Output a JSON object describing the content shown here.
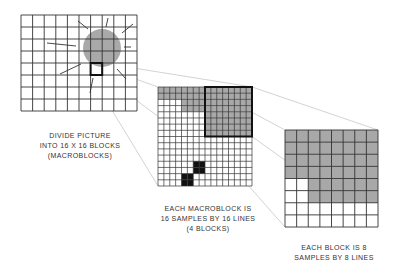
{
  "colors": {
    "grid_line": "#333333",
    "gray_fill": "#a8a8a8",
    "circle_fill": "#a9a9a9",
    "black_fill": "#111111",
    "projection_line": "#c8c8c8",
    "ray_line": "#333333"
  },
  "picture": {
    "caption": [
      "DIVIDE PICTURE",
      "INTO 16 X 16 BLOCKS",
      "(MACROBLOCKS)"
    ],
    "cols": 10,
    "rows": 8,
    "x": 21,
    "y": 15,
    "w": 116,
    "h": 96,
    "circle": {
      "cx": 102,
      "cy": 48,
      "r": 19
    },
    "highlight": {
      "col": 6,
      "row": 4
    },
    "rays": [
      [
        47,
        43,
        76,
        46
      ],
      [
        78,
        21,
        88,
        29
      ],
      [
        108,
        18,
        106,
        27
      ],
      [
        133,
        24,
        122,
        33
      ],
      [
        124,
        47,
        131,
        47
      ],
      [
        117,
        69,
        126,
        79
      ],
      [
        81,
        64,
        60,
        74
      ],
      [
        93,
        78,
        90,
        93
      ]
    ]
  },
  "macroblock": {
    "caption": [
      "EACH MACROBLOCK IS",
      "16 SAMPLES BY 16 LINES",
      "(4 BLOCKS)"
    ],
    "cols": 16,
    "rows": 16,
    "x": 158,
    "y": 87,
    "w": 94,
    "h": 99,
    "highlight_block": {
      "col": 8,
      "row": 0,
      "size": 8
    },
    "gray_rows": [
      [
        0,
        16
      ],
      [
        0,
        16
      ],
      [
        4,
        16
      ],
      [
        4,
        16
      ],
      [
        8,
        16
      ],
      [
        8,
        16
      ],
      [
        8,
        16
      ],
      [
        8,
        16
      ]
    ],
    "gray_rows_note_start_col_end_col": true,
    "black_cells": [
      [
        6,
        12
      ],
      [
        6,
        13
      ],
      [
        7,
        12
      ],
      [
        7,
        13
      ],
      [
        4,
        14
      ],
      [
        4,
        15
      ],
      [
        5,
        14
      ],
      [
        5,
        15
      ]
    ]
  },
  "block": {
    "caption": [
      "EACH BLOCK IS 8",
      "SAMPLES BY 8 LINES"
    ],
    "cols": 8,
    "rows": 8,
    "x": 285,
    "y": 130,
    "w": 93,
    "h": 97,
    "gray_rows": [
      [
        0,
        8
      ],
      [
        0,
        8
      ],
      [
        0,
        8
      ],
      [
        0,
        8
      ],
      [
        2,
        8
      ],
      [
        2,
        8
      ],
      [
        8,
        8
      ],
      [
        8,
        8
      ]
    ]
  }
}
